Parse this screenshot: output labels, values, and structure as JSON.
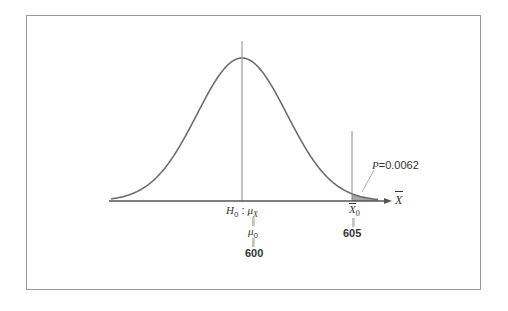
{
  "chart_data": {
    "type": "area",
    "title": "",
    "distribution": "normal",
    "mean": 600,
    "observed": 605,
    "p_value": 0.0062,
    "shaded_region": "right tail beyond X-bar_0 = 605",
    "xlabel": "X̄",
    "ylabel": "",
    "grid": false,
    "legend": null,
    "annotations": [
      {
        "text": "H0 : μX = μ0 = 600",
        "at": 600
      },
      {
        "text": "X̄0 = 605",
        "at": 605
      },
      {
        "text": "P=0.0062",
        "points_to": "shaded right tail"
      }
    ],
    "colors": {
      "curve": "#6e6e6e",
      "shade": "#a8a8a8",
      "axis": "#555555",
      "frame": "#9a9a9a"
    }
  },
  "labels": {
    "axis_x": "X",
    "h0_prefix": "H",
    "h0_sub": "0",
    "h0_colon": " : ",
    "mu": "μ",
    "mu_sub_x": "X",
    "mu_sub_0": "0",
    "equals_vertical": "||",
    "mean_value": "600",
    "xbar": "X",
    "xbar_sub": "0",
    "observed_value": "605",
    "p_label": "P",
    "p_value_text": "=0.0062"
  }
}
